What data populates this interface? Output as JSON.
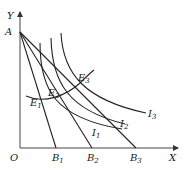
{
  "diagram": {
    "type": "price-consumption-curve",
    "axes": {
      "x_label": "X",
      "y_label": "Y",
      "origin_label": "O"
    },
    "intercept_point": {
      "label": "A"
    },
    "budget_lines": [
      {
        "id": "B1",
        "label": "B",
        "sub": "1"
      },
      {
        "id": "B2",
        "label": "B",
        "sub": "2"
      },
      {
        "id": "B3",
        "label": "B",
        "sub": "3"
      }
    ],
    "indifference_curves": [
      {
        "id": "I1",
        "label": "I",
        "sub": "1"
      },
      {
        "id": "I2",
        "label": "I",
        "sub": "2"
      },
      {
        "id": "I3",
        "label": "I",
        "sub": "3"
      }
    ],
    "equilibrium_points": [
      {
        "id": "E1",
        "label": "E",
        "sub": "1"
      },
      {
        "id": "E2",
        "label": "E",
        "sub": "2"
      },
      {
        "id": "E3",
        "label": "E",
        "sub": "3"
      }
    ]
  }
}
